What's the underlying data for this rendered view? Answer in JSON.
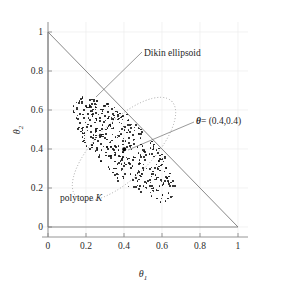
{
  "figure": {
    "background_color": "#ffffff",
    "line_color": "#6e6e6e",
    "grid_color": "#ebebeb",
    "point_color": "#111111",
    "text_color": "#2b2b2b"
  },
  "chart_data": {
    "type": "scatter",
    "title": "",
    "subtitle": "",
    "xlabel": "θ",
    "xlabel_sub": "1",
    "ylabel": "θ",
    "ylabel_sub": "2",
    "xlim": [
      -0.05,
      1.08
    ],
    "ylim": [
      -0.05,
      1.05
    ],
    "xticks": [
      0,
      0.2,
      0.4,
      0.6,
      0.8,
      1
    ],
    "xtick_labels": [
      "0",
      "0.2",
      "0.4",
      "0.6",
      "0.8",
      "1"
    ],
    "yticks": [
      0,
      0.2,
      0.4,
      0.6,
      0.8,
      1
    ],
    "ytick_labels": [
      "0",
      "0.2",
      "0.4",
      "0.6",
      "0.8",
      "1"
    ],
    "grid": true,
    "legend": "none",
    "annotations": [
      {
        "name": "dikin-ellipsoid-label",
        "text": "Dikin ellipsoid",
        "x": 0.53,
        "y": 0.905,
        "leader_to": [
          0.255,
          0.66
        ]
      },
      {
        "name": "theta-center-label",
        "text": "θ = (0.4,0.4)",
        "theta_symbol": "θ",
        "equals_value": "= (0.4,0.4)",
        "x": 0.8,
        "y": 0.565,
        "leader_to": [
          0.405,
          0.405
        ]
      },
      {
        "name": "polytope-label",
        "text": "polytope K",
        "word": "polytope",
        "symbol": "K",
        "x": 0.07,
        "y": 0.175
      }
    ],
    "polytope": {
      "name": "polytope K",
      "type": "triangle",
      "vertices": [
        [
          0,
          0
        ],
        [
          1,
          0
        ],
        [
          0,
          1
        ]
      ],
      "constraint": "θ₁ + θ₂ ≤ 1, θ ≥ 0"
    },
    "ellipse": {
      "name": "Dikin ellipsoid",
      "center": [
        0.4,
        0.4
      ],
      "semi_major": 0.355,
      "semi_minor": 0.145,
      "rotation_deg": -45,
      "style": "dotted"
    },
    "center_point": {
      "label": "θ = (0.4,0.4)",
      "x": 0.4,
      "y": 0.4
    },
    "scatter": {
      "name": "samples inside Dikin ellipsoid",
      "n_points": 430,
      "marker": "dot",
      "color": "#111111",
      "description": "Uniform-like random samples filling the tilted Dikin ellipsoid centered at (0.4,0.4)"
    }
  }
}
